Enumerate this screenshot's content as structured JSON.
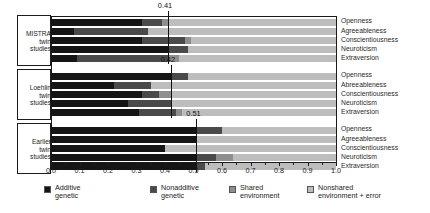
{
  "chart_data": {
    "type": "bar",
    "orientation": "horizontal",
    "stacked": true,
    "title": "",
    "xlabel": "",
    "ylabel": "",
    "xlim": [
      0.0,
      1.0
    ],
    "grid": false,
    "legend_position": "bottom",
    "xticks": [
      "0.0",
      "0.1",
      "0.2",
      "0.3",
      "0.4",
      "0.5",
      "0.6",
      "0.7",
      "0.8",
      "0.9",
      "1.0"
    ],
    "xtick_values": [
      0.0,
      0.1,
      0.2,
      0.3,
      0.4,
      0.5,
      0.6,
      0.7,
      0.8,
      0.9,
      1.0
    ],
    "series": [
      {
        "name": "Additive genetic",
        "key": "additive",
        "color": "#151515"
      },
      {
        "name": "Nonadditive genetic",
        "key": "nonadditive",
        "color": "#4a4a4a"
      },
      {
        "name": "Shared environment",
        "key": "shared",
        "color": "#8e8e8e"
      },
      {
        "name": "Nonshared environment + error",
        "key": "nonshared",
        "color": "#bdbdbd"
      }
    ],
    "groups": [
      {
        "label": "MISTRA\ntwin\nstudies",
        "label_lines": [
          "MISTRA",
          "twin",
          "studies"
        ],
        "mean": 0.41,
        "mean_label": "0.41",
        "bars": [
          {
            "trait": "Openness",
            "additive": 0.32,
            "nonadditive": 0.07,
            "shared": 0.02,
            "nonshared": 0.59
          },
          {
            "trait": "Agreeableness",
            "additive": 0.08,
            "nonadditive": 0.26,
            "shared": 0.0,
            "nonshared": 0.66
          },
          {
            "trait": "Conscientiousness",
            "additive": 0.32,
            "nonadditive": 0.15,
            "shared": 0.02,
            "nonshared": 0.51
          },
          {
            "trait": "Neuroticism",
            "additive": 0.41,
            "nonadditive": 0.07,
            "shared": 0.0,
            "nonshared": 0.52
          },
          {
            "trait": "Extraversion",
            "additive": 0.09,
            "nonadditive": 0.32,
            "shared": 0.04,
            "nonshared": 0.55
          }
        ]
      },
      {
        "label": "Loehlin\ntwin\nstudies",
        "label_lines": [
          "Loehlin",
          "twin",
          "studies"
        ],
        "mean": 0.42,
        "mean_label": "0.42",
        "bars": [
          {
            "trait": "Openness",
            "additive": 0.42,
            "nonadditive": 0.06,
            "shared": 0.0,
            "nonshared": 0.52
          },
          {
            "trait": "Abreeableness",
            "additive": 0.22,
            "nonadditive": 0.13,
            "shared": 0.0,
            "nonshared": 0.65
          },
          {
            "trait": "Conscientiousness",
            "additive": 0.32,
            "nonadditive": 0.06,
            "shared": 0.04,
            "nonshared": 0.58
          },
          {
            "trait": "Neuroticism",
            "additive": 0.27,
            "nonadditive": 0.15,
            "shared": 0.0,
            "nonshared": 0.58
          },
          {
            "trait": "Extraversion",
            "additive": 0.31,
            "nonadditive": 0.13,
            "shared": 0.02,
            "nonshared": 0.54
          }
        ]
      },
      {
        "label": "Earlier\ntwin\nstudies",
        "label_lines": [
          "Earlier",
          "twin",
          "studies"
        ],
        "mean": 0.51,
        "mean_label": "0.51",
        "bars": [
          {
            "trait": "Openness",
            "additive": 0.51,
            "nonadditive": 0.09,
            "shared": 0.0,
            "nonshared": 0.4
          },
          {
            "trait": "Agreeableness",
            "additive": 0.51,
            "nonadditive": 0.0,
            "shared": 0.0,
            "nonshared": 0.49
          },
          {
            "trait": "Conscientiousness",
            "additive": 0.4,
            "nonadditive": 0.0,
            "shared": 0.0,
            "nonshared": 0.6
          },
          {
            "trait": "Neuroticism",
            "additive": 0.51,
            "nonadditive": 0.07,
            "shared": 0.06,
            "nonshared": 0.36
          },
          {
            "trait": "Extraversion",
            "additive": 0.51,
            "nonadditive": 0.03,
            "shared": 0.0,
            "nonshared": 0.46
          }
        ]
      }
    ]
  },
  "legend": {
    "items": [
      {
        "label_line1": "Additive",
        "label_line2": "genetic",
        "color": "#151515"
      },
      {
        "label_line1": "Nonadditive",
        "label_line2": "genetic",
        "color": "#4a4a4a"
      },
      {
        "label_line1": "Shared",
        "label_line2": "environment",
        "color": "#8e8e8e"
      },
      {
        "label_line1": "Nonshared",
        "label_line2": "environment + error",
        "color": "#bdbdbd"
      }
    ]
  }
}
